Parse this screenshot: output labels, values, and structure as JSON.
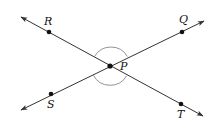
{
  "diagram": {
    "type": "intersecting-lines",
    "colors": {
      "line": "#333333",
      "point": "#111111",
      "arc": "#888888",
      "background": "#ffffff"
    },
    "points": {
      "R": {
        "label": "R",
        "x": 49,
        "y": 32,
        "label_x": 44,
        "label_y": 25
      },
      "Q": {
        "label": "Q",
        "x": 182,
        "y": 32,
        "label_x": 179,
        "label_y": 23
      },
      "P": {
        "label": "P",
        "x": 110,
        "y": 66,
        "label_x": 120,
        "label_y": 70
      },
      "S": {
        "label": "S",
        "x": 51,
        "y": 94,
        "label_x": 47,
        "label_y": 108
      },
      "T": {
        "label": "T",
        "x": 181,
        "y": 104,
        "label_x": 177,
        "label_y": 118
      }
    },
    "lines": [
      {
        "name": "line-RT",
        "through": [
          "R",
          "P",
          "T"
        ],
        "arrows": "both"
      },
      {
        "name": "line-SQ",
        "through": [
          "S",
          "P",
          "Q"
        ],
        "arrows": "both"
      }
    ],
    "angle_marks": [
      {
        "name": "angle-RPQ",
        "vertex": "P",
        "rays": [
          "R",
          "Q"
        ]
      },
      {
        "name": "angle-SPT",
        "vertex": "P",
        "rays": [
          "S",
          "T"
        ]
      }
    ]
  }
}
